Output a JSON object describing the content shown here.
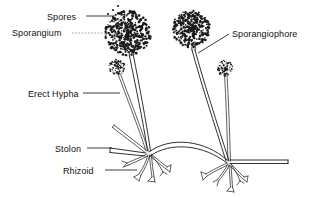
{
  "figure": {
    "background_color": "#ffffff",
    "ink_color": "#1a1a1a",
    "width": 320,
    "height": 198
  },
  "labels": {
    "spores": "Spores",
    "sporangium": "Sporangium",
    "erect_hypha": "Erect Hypha",
    "stolon": "Stolon",
    "rhizoid": "Rhizoid",
    "sporangiophore": "Sporangiophore"
  },
  "structures": {
    "sporangia": [
      {
        "name": "large-left-sporangium",
        "cx": 128,
        "cy": 33,
        "r": 23,
        "stipple_count": 430
      },
      {
        "name": "large-right-sporangium",
        "cx": 191,
        "cy": 29,
        "r": 19,
        "stipple_count": 320
      },
      {
        "name": "small-left-sporangium",
        "cx": 117,
        "cy": 67,
        "r": 8,
        "stipple_count": 70
      },
      {
        "name": "small-right-cSporangium",
        "cx": 225,
        "cy": 68,
        "r": 8,
        "stipple_count": 70
      }
    ],
    "nodes": [
      {
        "name": "left-node",
        "x": 148,
        "y": 152
      },
      {
        "name": "right-node",
        "x": 228,
        "y": 162
      }
    ],
    "stolon": {
      "name": "stolon-arc",
      "from_x": 148,
      "from_y": 152,
      "to_x": 228,
      "to_y": 162
    },
    "free_spores": [
      {
        "x": 113,
        "y": 10
      },
      {
        "x": 118,
        "y": 6
      },
      {
        "x": 108,
        "y": 14
      },
      {
        "x": 122,
        "y": 12
      }
    ]
  }
}
